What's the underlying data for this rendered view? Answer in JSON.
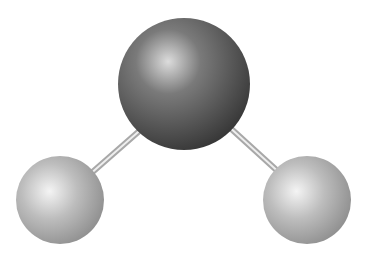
{
  "diagram": {
    "type": "ball-and-stick molecular model",
    "molecule": "water (H2O)",
    "background": "#ffffff",
    "atoms": [
      {
        "id": "center",
        "role": "oxygen",
        "cx": 184,
        "cy": 84,
        "r": 66,
        "highlight": "#d8d8d8",
        "mid": "#6e6e6e",
        "shadow": "#3c3c3c"
      },
      {
        "id": "left",
        "role": "hydrogen",
        "cx": 60,
        "cy": 200,
        "r": 44,
        "highlight": "#f2f2f2",
        "mid": "#bdbdbd",
        "shadow": "#8e8e8e"
      },
      {
        "id": "right",
        "role": "hydrogen",
        "cx": 307,
        "cy": 200,
        "r": 44,
        "highlight": "#f2f2f2",
        "mid": "#bdbdbd",
        "shadow": "#8e8e8e"
      }
    ],
    "bonds": [
      {
        "id": "left-bond",
        "x1": 145,
        "y1": 126,
        "x2": 88,
        "y2": 176
      },
      {
        "id": "right-bond",
        "x1": 227,
        "y1": 125,
        "x2": 283,
        "y2": 176
      }
    ],
    "bond_color": "#b0b0b0",
    "bond_highlight": "#eeeeee"
  }
}
